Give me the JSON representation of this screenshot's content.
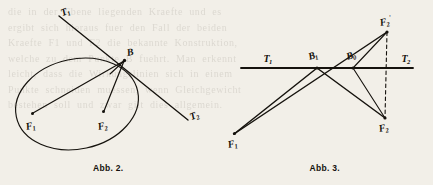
{
  "page": {
    "background": "#f2efe8",
    "ink": "#15120d",
    "bleed_text": "die  in  der  Ebene  liegenden  Kraefte  und  es\nergibt  sich  hieraus  fuer  den  Fall  der  beiden\nKraefte  F1  und  F2  die  bekannte  Konstruktion,\nwelche  zu  dem  Punkte  B  fuehrt.  Man  erkennt\nleicht,  dass  die  Wirkungslinien  sich  in  einem\nPunkte  schneiden  muessen,  wenn  Gleichgewicht\nbestehen  soll  und  zwar  gilt  dies  allgemein."
  },
  "figures": [
    {
      "id": "abb2",
      "caption": "Abb. 2.",
      "labels": [
        {
          "name": "label-T1",
          "text": "T",
          "sub": "1",
          "sup": "",
          "x": 63,
          "y": 8,
          "rot": -22
        },
        {
          "name": "label-T2",
          "text": "T",
          "sub": "2",
          "sup": "",
          "x": 192,
          "y": 112,
          "rot": -22
        },
        {
          "name": "label-B",
          "text": "B",
          "sub": "",
          "sup": "",
          "x": 128,
          "y": 48,
          "rot": -12
        },
        {
          "name": "label-F1",
          "text": "F",
          "sub": "1",
          "sup": "",
          "x": 27,
          "y": 122,
          "rot": -12
        },
        {
          "name": "label-F2",
          "text": "F",
          "sub": "2",
          "sup": "",
          "x": 99,
          "y": 122,
          "rot": -12
        }
      ],
      "geometry": {
        "ellipse": {
          "cx": 77,
          "cy": 104,
          "rx": 62,
          "ry": 45,
          "rotate": -12
        },
        "point_B": [
          124,
          61
        ],
        "point_F1": [
          32,
          114
        ],
        "point_F2": [
          103,
          112
        ],
        "ray_T1_start": [
          59,
          16
        ],
        "ray_T2_end": [
          188,
          120
        ]
      }
    },
    {
      "id": "abb3",
      "caption": "Abb. 3.",
      "labels": [
        {
          "name": "label-T1",
          "text": "T",
          "sub": "1",
          "sup": "",
          "x": 47,
          "y": 56,
          "rot": 0
        },
        {
          "name": "label-T2",
          "text": "T",
          "sub": "2",
          "sup": "",
          "x": 185,
          "y": 56,
          "rot": 0
        },
        {
          "name": "label-B1",
          "text": "B",
          "sub": "1",
          "sup": "",
          "x": 94,
          "y": 56,
          "rot": -18
        },
        {
          "name": "label-B0",
          "text": "B",
          "sub": "0",
          "sup": "",
          "x": 130,
          "y": 56,
          "rot": -18
        },
        {
          "name": "label-F2prime",
          "text": "F",
          "sub": "2",
          "sup": "'",
          "x": 167,
          "y": 24,
          "rot": -12
        },
        {
          "name": "label-F1",
          "text": "F",
          "sub": "1",
          "sup": "",
          "x": 14,
          "y": 140,
          "rot": -12
        },
        {
          "name": "label-F2",
          "text": "F",
          "sub": "2",
          "sup": "",
          "x": 165,
          "y": 130,
          "rot": -12
        }
      ],
      "geometry": {
        "axis_y": 68,
        "axis_x1": 24,
        "axis_x2": 196,
        "point_B1": [
          100,
          68
        ],
        "point_B0": [
          136,
          68
        ],
        "point_F2prime": [
          170,
          32
        ],
        "point_F1": [
          17,
          134
        ],
        "point_F2": [
          168,
          118
        ],
        "dashed_from": [
          170,
          32
        ],
        "dashed_to": [
          168,
          118
        ]
      }
    }
  ]
}
